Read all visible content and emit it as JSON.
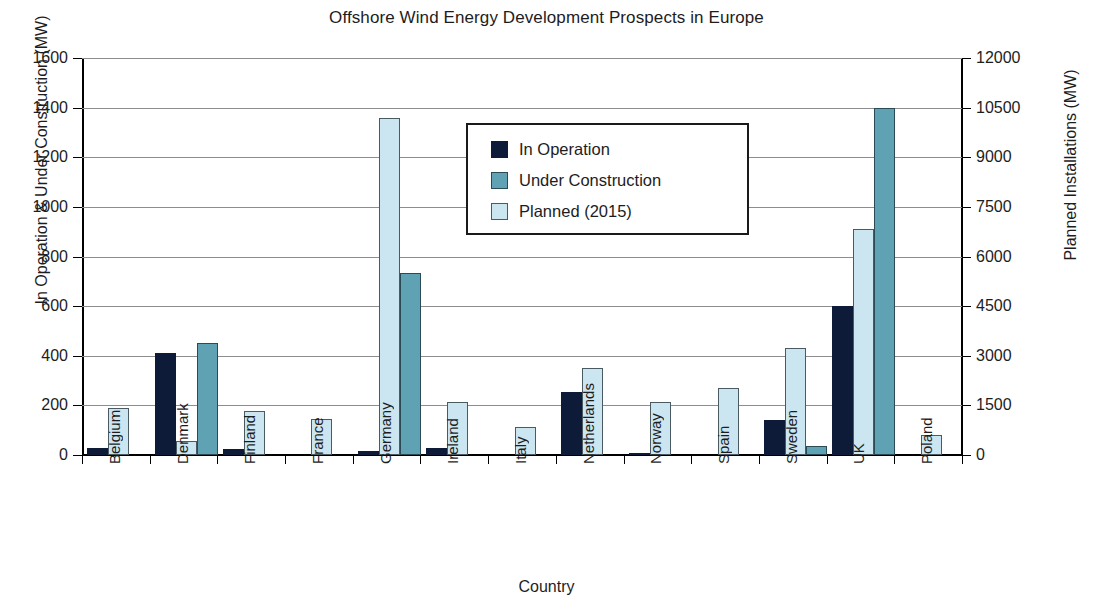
{
  "chart_data": {
    "type": "bar",
    "title": "Offshore Wind Energy Development Prospects in Europe",
    "xlabel": "Country",
    "ylabel": "In Operation & Under Construction (MW)",
    "ylabel_secondary": "Planned Installations (MW)",
    "categories": [
      "Belgium",
      "Denmark",
      "Finland",
      "France",
      "Germany",
      "Ireland",
      "Italy",
      "Netherlands",
      "Norway",
      "Spain",
      "Sweden",
      "UK",
      "Poland"
    ],
    "series": [
      {
        "name": "In Operation",
        "axis": "left",
        "color": "#0d1b38",
        "values": [
          30,
          410,
          25,
          0,
          15,
          28,
          0,
          255,
          5,
          0,
          140,
          600,
          0
        ]
      },
      {
        "name": "Under Construction",
        "axis": "left",
        "color": "#5fa2b4",
        "values": [
          0,
          450,
          0,
          0,
          735,
          0,
          0,
          0,
          0,
          0,
          35,
          1400,
          0
        ]
      },
      {
        "name": "Planned (2015)",
        "axis": "right",
        "color": "#cbe5f1",
        "values": [
          1425,
          420,
          1335,
          1090,
          10200,
          1610,
          860,
          2625,
          1590,
          2025,
          3225,
          6825,
          615
        ]
      }
    ],
    "draw_order": [
      "In Operation",
      "Planned (2015)",
      "Under Construction"
    ],
    "ylim": [
      0,
      1600
    ],
    "ylim_secondary": [
      0,
      12000
    ],
    "yticks": [
      "1600",
      "1400",
      "1200",
      "1000",
      "800",
      "600",
      "400",
      "200",
      "0"
    ],
    "yticks_secondary": [
      "12000",
      "10500",
      "9000",
      "7500",
      "6000",
      "4500",
      "3000",
      "1500",
      "0"
    ],
    "grid": true,
    "legend_position": "upper center",
    "legend_entries": [
      "In Operation",
      "Under Construction",
      "Planned (2015)"
    ]
  }
}
